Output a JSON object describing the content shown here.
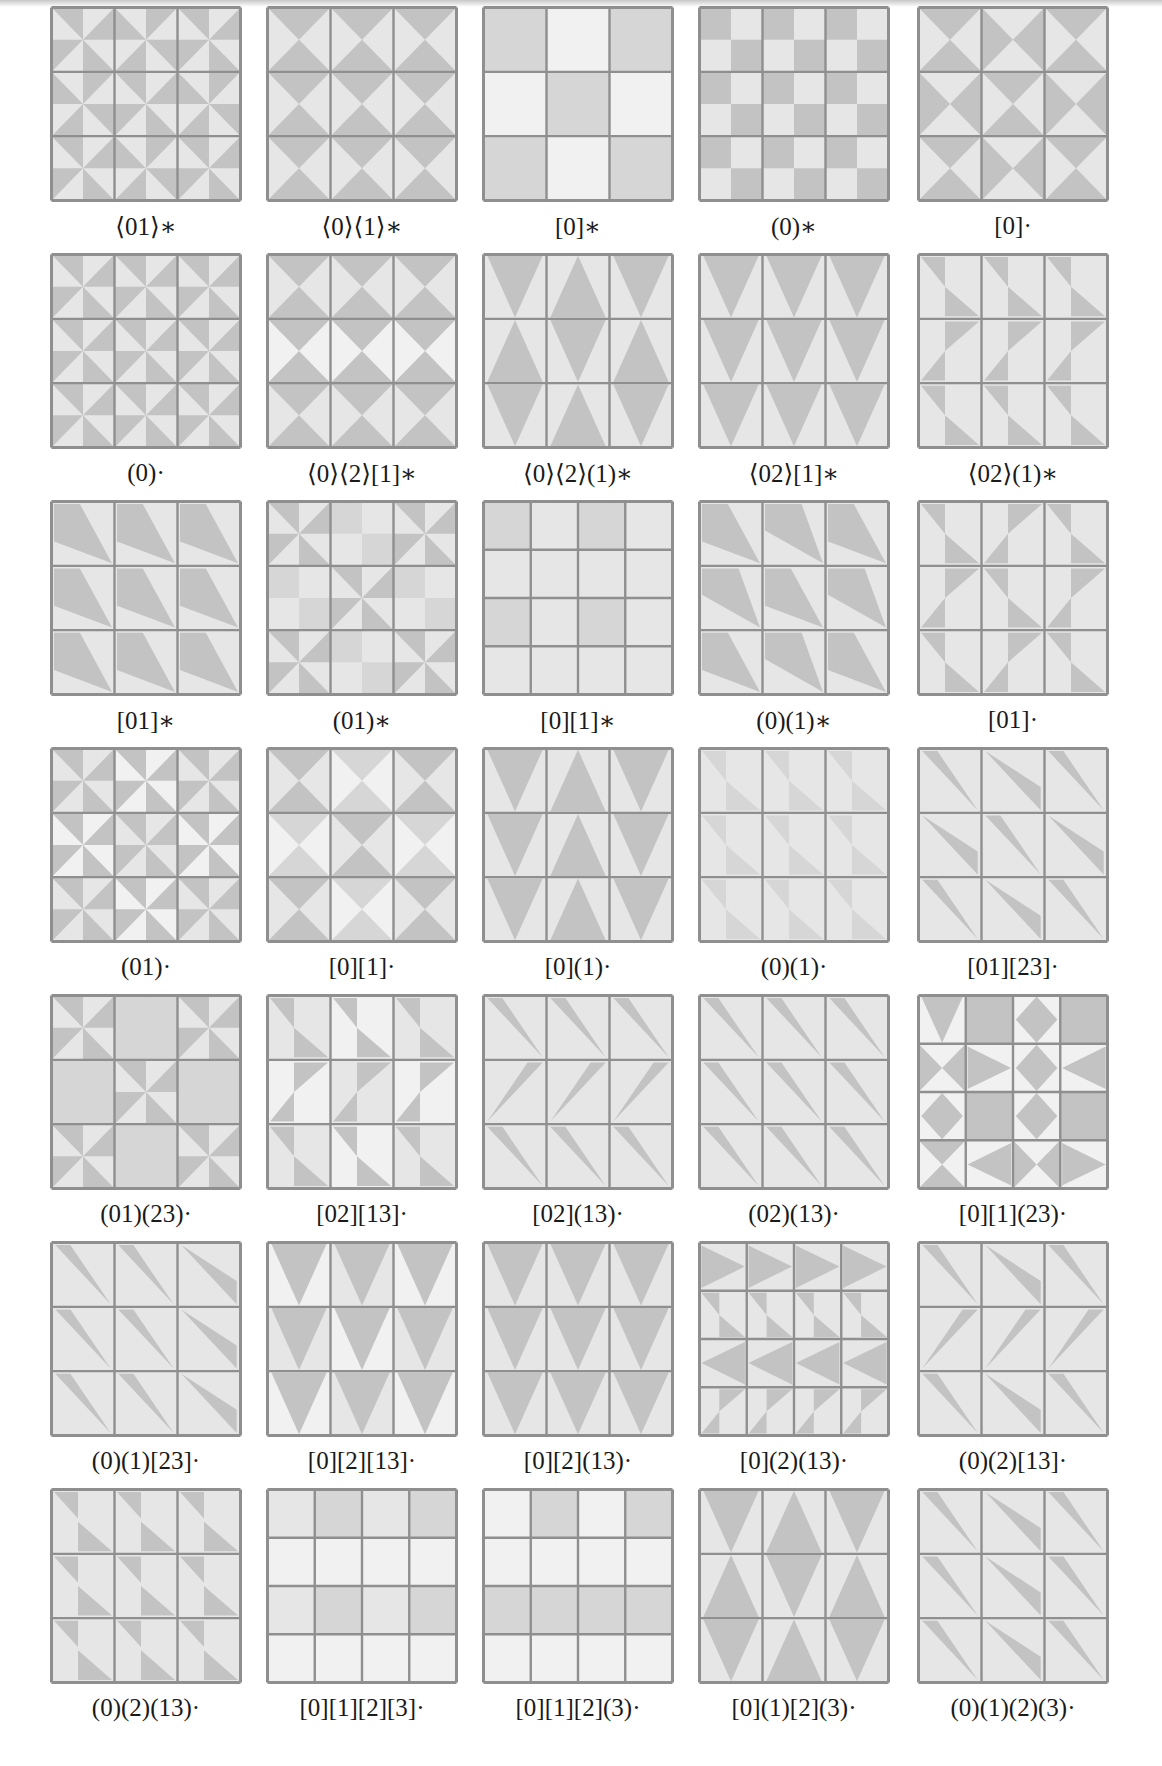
{
  "figure": {
    "colors": {
      "grid": "#8f8f8f",
      "base": "#e6e6e6",
      "dark": "#c3c3c3",
      "light": "#f1f1f1",
      "mid": "#d6d6d6"
    },
    "columns_x": [
      50,
      266,
      482,
      698,
      917
    ],
    "row_y0": 6,
    "row_pitch": 247,
    "panels": [
      {
        "label": "⟨01⟩∗",
        "n": 3,
        "motif": "pinA"
      },
      {
        "label": "⟨0⟩⟨1⟩∗",
        "n": 3,
        "motif": "hgV"
      },
      {
        "label": "[0]∗",
        "n": 3,
        "motif": "plainAlt"
      },
      {
        "label": "(0)∗",
        "n": 3,
        "motif": "chk"
      },
      {
        "label": "[0]·",
        "n": 3,
        "motif": "hgVH"
      },
      {
        "label": "(0)·",
        "n": 3,
        "motif": "pinB"
      },
      {
        "label": "⟨0⟩⟨2⟩[1]∗",
        "n": 3,
        "motif": "hgVrows"
      },
      {
        "label": "⟨0⟩⟨2⟩(1)∗",
        "n": 3,
        "motif": "triAlt"
      },
      {
        "label": "⟨02⟩[1]∗",
        "n": 3,
        "motif": "tdown"
      },
      {
        "label": "⟨02⟩(1)∗",
        "n": 3,
        "motif": "zz"
      },
      {
        "label": "[01]∗",
        "n": 3,
        "motif": "kite"
      },
      {
        "label": "(01)∗",
        "n": 3,
        "motif": "pinChk"
      },
      {
        "label": "[0][1]∗",
        "n": 4,
        "motif": "plain4"
      },
      {
        "label": "(0)(1)∗",
        "n": 3,
        "motif": "kiteAlt"
      },
      {
        "label": "[01]·",
        "n": 3,
        "motif": "zzAlt"
      },
      {
        "label": "(01)·",
        "n": 3,
        "motif": "pinC"
      },
      {
        "label": "[0][1]·",
        "n": 3,
        "motif": "hgVshade"
      },
      {
        "label": "[0](1)·",
        "n": 3,
        "motif": "triCols"
      },
      {
        "label": "(0)(1)·",
        "n": 3,
        "motif": "zzThin"
      },
      {
        "label": "[01][23]·",
        "n": 3,
        "motif": "sliverAlt"
      },
      {
        "label": "(01)(23)·",
        "n": 3,
        "motif": "pinSparse"
      },
      {
        "label": "[02][13]·",
        "n": 3,
        "motif": "zzShade"
      },
      {
        "label": "[02](13)·",
        "n": 3,
        "motif": "sliverZ"
      },
      {
        "label": "(02)(13)·",
        "n": 3,
        "motif": "sliver"
      },
      {
        "label": "[0][1](23)·",
        "n": 4,
        "motif": "star4"
      },
      {
        "label": "(0)(1)[23]·",
        "n": 3,
        "motif": "sliverMix"
      },
      {
        "label": "[0][2][13]·",
        "n": 3,
        "motif": "tdownShade"
      },
      {
        "label": "[0][2](13)·",
        "n": 3,
        "motif": "tdown"
      },
      {
        "label": "[0](2)(13)·",
        "n": 4,
        "motif": "arrow4"
      },
      {
        "label": "(0)(2)[13]·",
        "n": 3,
        "motif": "sliverZ2"
      },
      {
        "label": "(0)(2)(13)·",
        "n": 3,
        "motif": "zzHalf"
      },
      {
        "label": "[0][1][2][3]·",
        "n": 4,
        "motif": "plain4b"
      },
      {
        "label": "[0][1][2](3)·",
        "n": 4,
        "motif": "plain4c"
      },
      {
        "label": "[0](1)[2](3)·",
        "n": 3,
        "motif": "triAlt"
      },
      {
        "label": "(0)(1)(2)(3)·",
        "n": 3,
        "motif": "sliverMix2"
      }
    ]
  }
}
